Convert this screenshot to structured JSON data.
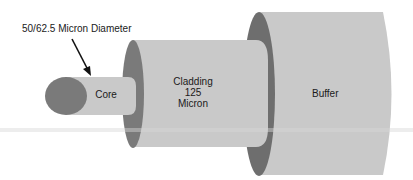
{
  "diagram": {
    "type": "fiber-optic-cable-cross-section",
    "colors": {
      "background": "#ffffff",
      "body_fill": "#c9c9c9",
      "end_face": "#7a7a7a",
      "buffer_ring": "#6e6e6e",
      "text": "#1a1a1a",
      "artifact_band": "#d6d6d6"
    },
    "callout": {
      "label": "50/62.5 Micron Diameter",
      "arrow": "arrow-pointing-to-core"
    },
    "layers": [
      {
        "id": "core",
        "label": "Core"
      },
      {
        "id": "cladding",
        "label_lines": [
          "Cladding",
          "125",
          "Micron"
        ]
      },
      {
        "id": "buffer",
        "label": "Buffer"
      }
    ]
  }
}
